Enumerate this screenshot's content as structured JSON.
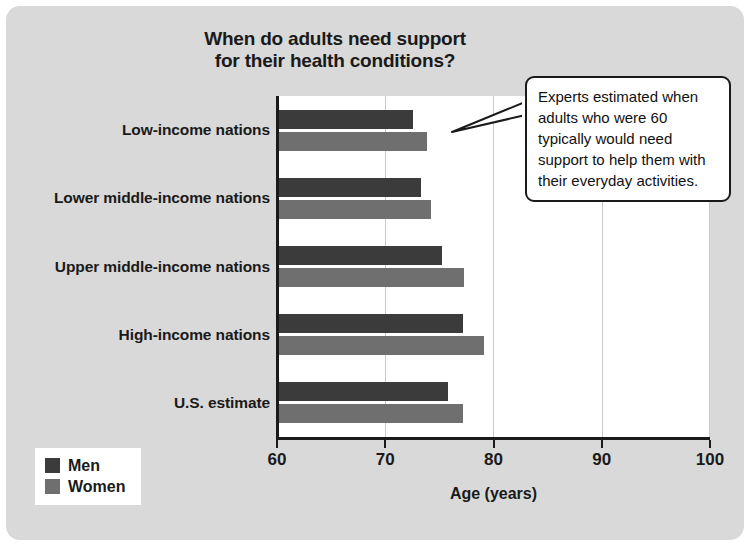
{
  "chart_data": {
    "type": "bar",
    "orientation": "horizontal",
    "title": "When do adults need support for their health conditions?",
    "title_lines": [
      "When do adults need support",
      "for their health conditions?"
    ],
    "xlabel": "Age (years)",
    "ylabel": "",
    "xlim": [
      60,
      100
    ],
    "xticks": [
      60,
      70,
      80,
      90,
      100
    ],
    "xtick_labels": [
      "60",
      "70",
      "80",
      "90",
      "100"
    ],
    "grid": "vertical",
    "legend_position": "bottom-left",
    "categories": [
      "Low-income nations",
      "Lower middle-income nations",
      "Upper middle-income nations",
      "High-income nations",
      "U.S. estimate"
    ],
    "series": [
      {
        "name": "Men",
        "color": "#3b3b3b",
        "values": [
          72.6,
          73.3,
          75.2,
          77.2,
          75.8
        ]
      },
      {
        "name": "Women",
        "color": "#6f6f6f",
        "values": [
          73.9,
          74.2,
          77.3,
          79.1,
          77.2
        ]
      }
    ],
    "annotations": [
      {
        "text": "Experts estimated when adults who were 60 typically would need support to help them with their everyday activities.",
        "lines": [
          "Experts estimated when",
          "adults who were 60",
          "typically would need",
          "support to help them with",
          "their everyday activities."
        ],
        "points_to": "Low-income nations"
      }
    ]
  },
  "legend": {
    "items": [
      {
        "label": "Men",
        "color": "#3b3b3b"
      },
      {
        "label": "Women",
        "color": "#6f6f6f"
      }
    ]
  },
  "colors": {
    "card_background": "#d9d9d9",
    "plot_background": "#ffffff",
    "axis": "#1a1a1a",
    "gridline": "#c9c9c9",
    "men": "#3b3b3b",
    "women": "#6f6f6f"
  }
}
